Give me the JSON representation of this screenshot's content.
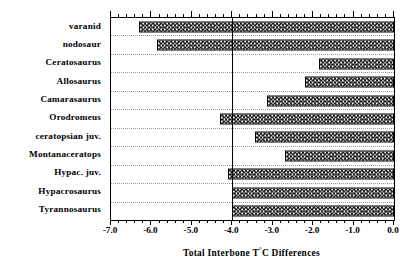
{
  "chart_data": {
    "type": "bar",
    "orientation": "horizontal",
    "title": "",
    "xlabel": "Total Interbone T°C Differences",
    "ylabel": "",
    "xlim": [
      -7.0,
      0.0
    ],
    "grid": true,
    "legend": null,
    "reference_line": -4.0,
    "xticks_major": [
      -7.0,
      -6.0,
      -5.0,
      -4.0,
      -3.0,
      -2.0,
      -1.0,
      0.0
    ],
    "xtick_labels": [
      "-7.0",
      "-6.0",
      "-5.0",
      "-4.0",
      "-3.0",
      "-2.0",
      "-1.0",
      "0.0"
    ],
    "xtick_minor_step": 0.2,
    "categories": [
      "varanid",
      "nodosaur",
      "Ceratosaurus",
      "Allosaurus",
      "Camarasaurus",
      "Orodromeus",
      "ceratopsian juv.",
      "Montanaceratops",
      "Hypac. juv.",
      "Hypacrosaurus",
      "Tyrannosaurus"
    ],
    "values": [
      -6.3,
      -5.85,
      -1.85,
      -2.2,
      -3.15,
      -4.3,
      -3.45,
      -2.7,
      -4.1,
      -4.0,
      -4.0
    ],
    "bar_fill": "stipple-speckle",
    "bar_edge_color": "#000000",
    "axis_color": "#000000",
    "background_color": "#ffffff"
  },
  "axis": {
    "x_title_prefix": "Total Interbone T",
    "x_title_degree": "°",
    "x_title_suffix": "C Differences"
  }
}
